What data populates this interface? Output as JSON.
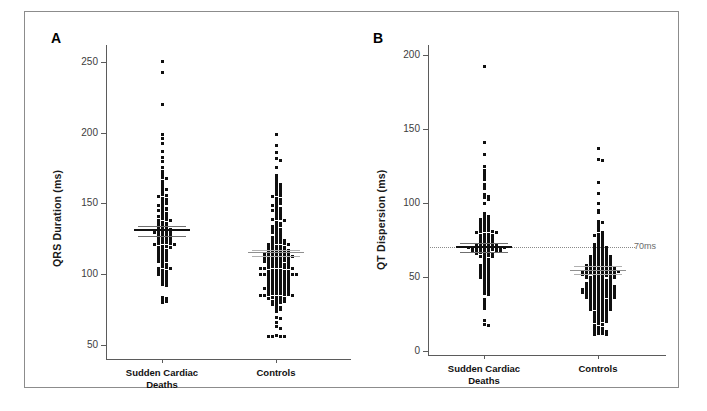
{
  "figure": {
    "border_color": "#8c8c8c",
    "background": "#ffffff"
  },
  "panels": [
    {
      "letter": "A",
      "ylabel": "QRS Duration (ms)",
      "yticks": [
        "50",
        "100",
        "150",
        "200",
        "250"
      ],
      "groups": [
        "Sudden Cardiac\nDeaths",
        "Controls"
      ]
    },
    {
      "letter": "B",
      "ylabel": "QT Dispersion (ms)",
      "yticks": [
        "0",
        "50",
        "100",
        "150",
        "200"
      ],
      "groups": [
        "Sudden Cardiac\nDeaths",
        "Controls"
      ],
      "reference_label": "70ms"
    }
  ],
  "chart_data": [
    {
      "type": "scatter",
      "panel": "A",
      "title": "",
      "xlabel": "",
      "ylabel": "QRS Duration (ms)",
      "ylim": [
        40,
        260
      ],
      "yticks": [
        50,
        100,
        150,
        200,
        250
      ],
      "grid": false,
      "legend": "none",
      "categories": [
        "Sudden Cardiac Deaths",
        "Controls"
      ],
      "units": "ms",
      "series": [
        {
          "name": "Sudden Cardiac Deaths",
          "mean": 131,
          "ci_low": 127,
          "ci_high": 134,
          "n": 121,
          "values": [
            251,
            243,
            220,
            199,
            196,
            193,
            187,
            183,
            180,
            176,
            173,
            171,
            169,
            168,
            166,
            164,
            163,
            161,
            160,
            159,
            157,
            156,
            155,
            154,
            153,
            152,
            151,
            150,
            150,
            149,
            148,
            147,
            146,
            146,
            145,
            144,
            143,
            142,
            141,
            141,
            140,
            139,
            138,
            138,
            137,
            136,
            136,
            135,
            134,
            134,
            133,
            133,
            132,
            132,
            131,
            131,
            130,
            130,
            130,
            129,
            129,
            128,
            128,
            127,
            127,
            126,
            126,
            125,
            125,
            124,
            124,
            123,
            123,
            122,
            122,
            121,
            121,
            120,
            120,
            119,
            119,
            118,
            117,
            117,
            116,
            115,
            115,
            114,
            113,
            113,
            112,
            112,
            111,
            110,
            110,
            109,
            108,
            107,
            106,
            105,
            104,
            104,
            103,
            102,
            102,
            101,
            100,
            100,
            99,
            98,
            97,
            96,
            95,
            94,
            93,
            92,
            84,
            83,
            82,
            81,
            80
          ]
        },
        {
          "name": "Controls",
          "mean": 115,
          "ci_low": 113,
          "ci_high": 117,
          "n": 210,
          "values": [
            199,
            191,
            186,
            182,
            181,
            176,
            170,
            168,
            166,
            165,
            164,
            163,
            162,
            161,
            160,
            159,
            158,
            157,
            156,
            155,
            154,
            153,
            152,
            151,
            150,
            150,
            149,
            148,
            147,
            146,
            145,
            145,
            144,
            143,
            142,
            141,
            140,
            140,
            139,
            138,
            137,
            136,
            135,
            135,
            134,
            133,
            132,
            132,
            131,
            130,
            130,
            129,
            128,
            127,
            127,
            126,
            125,
            125,
            124,
            124,
            123,
            123,
            122,
            122,
            121,
            121,
            120,
            120,
            120,
            119,
            119,
            118,
            118,
            118,
            117,
            117,
            117,
            116,
            116,
            116,
            115,
            115,
            115,
            115,
            114,
            114,
            114,
            114,
            113,
            113,
            113,
            113,
            112,
            112,
            112,
            112,
            111,
            111,
            111,
            110,
            110,
            110,
            110,
            109,
            109,
            109,
            108,
            108,
            108,
            107,
            107,
            107,
            106,
            106,
            106,
            105,
            105,
            105,
            104,
            104,
            104,
            103,
            103,
            103,
            102,
            102,
            102,
            101,
            101,
            101,
            100,
            100,
            100,
            100,
            100,
            100,
            100,
            99,
            99,
            99,
            98,
            98,
            98,
            97,
            97,
            97,
            96,
            96,
            96,
            95,
            95,
            95,
            94,
            94,
            94,
            93,
            93,
            93,
            92,
            92,
            92,
            91,
            91,
            91,
            90,
            90,
            90,
            90,
            89,
            89,
            89,
            88,
            88,
            88,
            87,
            87,
            87,
            86,
            86,
            86,
            85,
            85,
            85,
            84,
            84,
            84,
            83,
            83,
            82,
            82,
            81,
            81,
            80,
            80,
            79,
            78,
            77,
            76,
            75,
            74,
            70,
            69,
            66,
            63,
            62,
            57,
            56,
            56,
            56,
            56
          ]
        }
      ]
    },
    {
      "type": "scatter",
      "panel": "B",
      "title": "",
      "xlabel": "",
      "ylabel": "QT Dispersion (ms)",
      "ylim": [
        0,
        205
      ],
      "yticks": [
        0,
        50,
        100,
        150,
        200
      ],
      "grid": false,
      "legend": "none",
      "reference_line": {
        "value": 70,
        "label": "70ms",
        "style": "dotted"
      },
      "categories": [
        "Sudden Cardiac Deaths",
        "Controls"
      ],
      "units": "ms",
      "series": [
        {
          "name": "Sudden Cardiac Deaths",
          "mean": 70,
          "ci_low": 67,
          "ci_high": 73,
          "n": 120,
          "values": [
            193,
            141,
            133,
            125,
            122,
            120,
            118,
            116,
            113,
            112,
            110,
            106,
            105,
            104,
            103,
            100,
            93,
            92,
            91,
            90,
            89,
            89,
            88,
            88,
            87,
            86,
            86,
            85,
            84,
            84,
            83,
            82,
            82,
            81,
            81,
            80,
            80,
            79,
            79,
            78,
            78,
            77,
            77,
            76,
            76,
            75,
            75,
            74,
            74,
            73,
            73,
            73,
            72,
            72,
            72,
            71,
            71,
            71,
            71,
            70,
            70,
            70,
            70,
            70,
            70,
            69,
            69,
            69,
            69,
            68,
            68,
            68,
            68,
            67,
            67,
            67,
            66,
            66,
            65,
            65,
            64,
            64,
            63,
            62,
            61,
            60,
            59,
            58,
            58,
            57,
            56,
            56,
            55,
            54,
            54,
            53,
            52,
            52,
            51,
            50,
            50,
            49,
            48,
            47,
            46,
            45,
            44,
            43,
            42,
            41,
            40,
            39,
            38,
            35,
            33,
            31,
            29,
            21,
            18,
            17
          ]
        },
        {
          "name": "Controls",
          "mean": 54,
          "ci_low": 52,
          "ci_high": 57,
          "n": 205,
          "values": [
            137,
            130,
            129,
            114,
            107,
            100,
            95,
            94,
            88,
            87,
            86,
            84,
            82,
            80,
            79,
            78,
            78,
            77,
            76,
            75,
            74,
            73,
            73,
            72,
            71,
            71,
            70,
            70,
            69,
            69,
            68,
            68,
            67,
            67,
            66,
            66,
            65,
            65,
            65,
            64,
            64,
            64,
            63,
            63,
            63,
            62,
            62,
            62,
            61,
            61,
            61,
            60,
            60,
            60,
            59,
            59,
            59,
            58,
            58,
            58,
            58,
            57,
            57,
            57,
            57,
            56,
            56,
            56,
            56,
            55,
            55,
            55,
            55,
            55,
            54,
            54,
            54,
            54,
            54,
            53,
            53,
            53,
            53,
            53,
            52,
            52,
            52,
            52,
            51,
            51,
            51,
            51,
            50,
            50,
            50,
            50,
            49,
            49,
            49,
            48,
            48,
            48,
            47,
            47,
            47,
            46,
            46,
            46,
            46,
            45,
            45,
            45,
            45,
            44,
            44,
            44,
            44,
            43,
            43,
            43,
            43,
            42,
            42,
            42,
            42,
            42,
            41,
            41,
            41,
            41,
            40,
            40,
            40,
            40,
            40,
            39,
            39,
            39,
            39,
            38,
            38,
            38,
            38,
            37,
            37,
            37,
            37,
            36,
            36,
            36,
            36,
            35,
            35,
            35,
            34,
            34,
            34,
            33,
            33,
            33,
            32,
            32,
            32,
            31,
            31,
            31,
            30,
            30,
            30,
            29,
            29,
            29,
            28,
            28,
            28,
            27,
            27,
            26,
            26,
            25,
            25,
            24,
            24,
            23,
            23,
            22,
            22,
            21,
            21,
            20,
            20,
            19,
            18,
            17,
            16,
            15,
            15,
            14,
            14,
            13,
            13,
            12,
            12,
            11,
            11
          ]
        }
      ]
    }
  ]
}
